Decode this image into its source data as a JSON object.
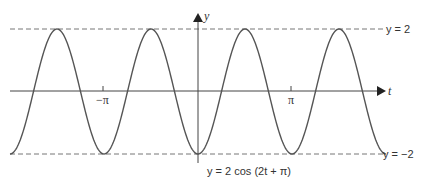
{
  "diagram": {
    "axes": {
      "x_label": "t",
      "y_label": "y",
      "ticks": [
        {
          "label": "−π",
          "value": -3.14159
        },
        {
          "label": "π",
          "value": 3.14159
        }
      ]
    },
    "asymptote_labels": {
      "upper": "y = 2",
      "lower": "y = −2"
    },
    "caption": "y = 2 cos (2t + π)",
    "colors": {
      "curve": "#555555",
      "axes": "#444444",
      "dashed": "#777777"
    }
  },
  "chart_data": {
    "type": "line",
    "title": "y = 2 cos (2t + π)",
    "xlabel": "t",
    "ylabel": "y",
    "function": "2*cos(2*t + pi)",
    "xlim": [
      -6.2832,
      6.2832
    ],
    "ylim": [
      -2,
      2
    ],
    "reference_lines": [
      {
        "y": 2,
        "style": "dashed",
        "label": "y = 2"
      },
      {
        "y": -2,
        "style": "dashed",
        "label": "y = −2"
      }
    ],
    "x_ticks": [
      "−π",
      "π"
    ],
    "key_points": [
      {
        "t": -6.2832,
        "y": -2
      },
      {
        "t": -4.7124,
        "y": 2
      },
      {
        "t": -3.1416,
        "y": -2
      },
      {
        "t": -1.5708,
        "y": 2
      },
      {
        "t": 0,
        "y": -2
      },
      {
        "t": 1.5708,
        "y": 2
      },
      {
        "t": 3.1416,
        "y": -2
      },
      {
        "t": 4.7124,
        "y": 2
      },
      {
        "t": 6.2832,
        "y": -2
      }
    ],
    "grid": false
  }
}
